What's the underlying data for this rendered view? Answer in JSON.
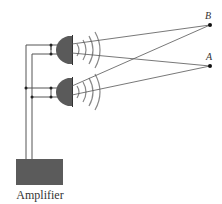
{
  "diagram": {
    "amplifier_label": "Amplifier",
    "points": [
      {
        "name": "B",
        "label": "B"
      },
      {
        "name": "A",
        "label": "A"
      }
    ],
    "speakers": [
      "top-speaker",
      "bottom-speaker"
    ],
    "colors": {
      "speaker": "#5a5a5a",
      "amplifier": "#5b5b5b",
      "lines": "#555555",
      "waves": "#888888"
    }
  }
}
